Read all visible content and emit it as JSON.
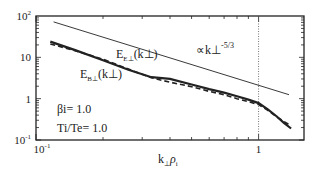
{
  "chart_data": {
    "type": "line",
    "title": "",
    "xlabel": "k⊥ρi",
    "ylabel": "",
    "xscale": "log",
    "yscale": "log",
    "xlim": [
      0.1,
      1.6
    ],
    "ylim": [
      0.1,
      100
    ],
    "x_ticks": [
      {
        "value": 0.1,
        "label": "10",
        "exp": "-1"
      },
      {
        "value": 1,
        "label": "1",
        "exp": ""
      }
    ],
    "y_ticks": [
      {
        "value": 0.1,
        "label": "10",
        "exp": "-1"
      },
      {
        "value": 1,
        "label": "1",
        "exp": ""
      },
      {
        "value": 10,
        "label": "10",
        "exp": ""
      },
      {
        "value": 100,
        "label": "10",
        "exp": "2"
      }
    ],
    "vline": {
      "x": 1,
      "style": "dotted"
    },
    "series": [
      {
        "name": "E_B⊥(k⊥)",
        "style": "solid-thick",
        "x": [
          0.116,
          0.15,
          0.2,
          0.26,
          0.33,
          0.4,
          0.5,
          0.6,
          0.7,
          0.8,
          0.9,
          1.0,
          1.1,
          1.2,
          1.3,
          1.4
        ],
        "y": [
          24,
          15,
          8.5,
          5.0,
          3.3,
          3.0,
          2.2,
          1.7,
          1.4,
          1.15,
          0.95,
          0.78,
          0.55,
          0.38,
          0.26,
          0.19
        ]
      },
      {
        "name": "E_E⊥(k⊥)",
        "style": "dashed",
        "x": [
          0.116,
          0.15,
          0.2,
          0.26,
          0.33,
          0.4,
          0.5,
          0.6,
          0.7,
          0.8,
          0.9,
          1.0,
          1.1,
          1.2,
          1.3,
          1.4
        ],
        "y": [
          21,
          14.5,
          9.0,
          5.2,
          3.2,
          2.5,
          1.95,
          1.5,
          1.25,
          1.0,
          0.85,
          0.72,
          0.52,
          0.37,
          0.28,
          0.22
        ]
      },
      {
        "name": "reference ∝ k⊥^-5/3",
        "style": "thin",
        "x": [
          0.12,
          1.37
        ],
        "y": [
          72,
          1.25
        ]
      }
    ],
    "annotations": {
      "ref_label": "∝k⊥",
      "ref_exp": "-5/3",
      "ee_label": "E",
      "ee_sub": "E⊥",
      "ee_arg": "(k⊥)",
      "eb_label": "E",
      "eb_sub": "B⊥",
      "eb_arg": "(k⊥)",
      "beta": "βi= 1.0",
      "temp": "Ti/Te= 1.0"
    },
    "xaxis_label_main": "k",
    "xaxis_label_sub1": "⊥",
    "xaxis_label_rho": "ρ",
    "xaxis_label_sub2": "i",
    "grid": false,
    "legend": "none"
  }
}
